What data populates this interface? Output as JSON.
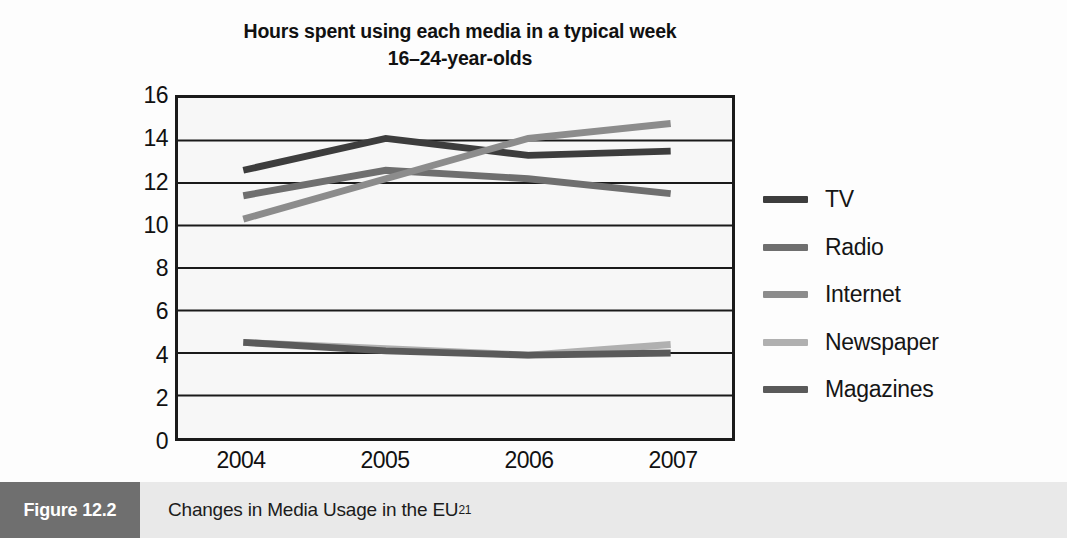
{
  "chart_data": {
    "type": "line",
    "title": "Hours spent using each media in a typical week\n16–24-year-olds",
    "title_line1": "Hours spent using each media in a typical week",
    "title_line2": "16–24-year-olds",
    "xlabel": "",
    "ylabel": "Hours per week",
    "x": [
      "2004",
      "2005",
      "2006",
      "2007"
    ],
    "categories": [
      "2004",
      "2005",
      "2006",
      "2007"
    ],
    "ylim": [
      0,
      16
    ],
    "ytick_step": 2,
    "yticks": [
      "16",
      "14",
      "12",
      "10",
      "8",
      "6",
      "4",
      "2",
      "0"
    ],
    "grid": "horizontal",
    "legend_position": "right",
    "series": [
      {
        "name": "TV",
        "values": [
          12.6,
          14.1,
          13.3,
          13.5
        ],
        "color": "#3d3d3d"
      },
      {
        "name": "Radio",
        "values": [
          11.4,
          12.6,
          12.2,
          11.5
        ],
        "color": "#6f6f6f"
      },
      {
        "name": "Internet",
        "values": [
          10.3,
          12.2,
          14.1,
          14.8
        ],
        "color": "#8c8c8c"
      },
      {
        "name": "Newspaper",
        "values": [
          4.5,
          4.2,
          3.9,
          4.4
        ],
        "color": "#b0b0b0"
      },
      {
        "name": "Magazines",
        "values": [
          4.5,
          4.1,
          3.9,
          4.0
        ],
        "color": "#5a5a5a"
      }
    ]
  },
  "caption": {
    "figure_number": "Figure 12.2",
    "text": "Changes in Media Usage in the EU",
    "footnote_marker": "21"
  },
  "colors": {
    "plot_background": "#f7f7f7",
    "axis": "#1a1a1a",
    "gridline": "#1a1a1a",
    "caption_bar": "#e9e9e9",
    "caption_box": "#6f6f6f"
  }
}
